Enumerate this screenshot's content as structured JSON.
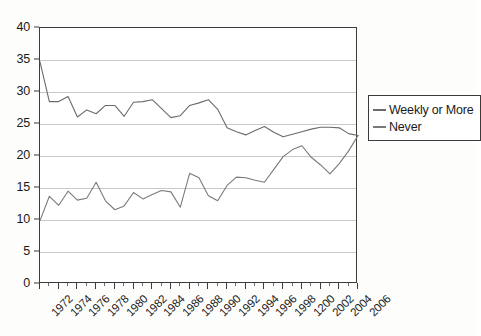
{
  "chart_data": {
    "type": "line",
    "title": "",
    "subtitle": "",
    "xlabel": "",
    "ylabel": "",
    "xlim": [
      1972,
      2006
    ],
    "ylim": [
      0,
      40
    ],
    "grid": true,
    "legend_position": "right",
    "y_ticks": [
      0,
      5,
      10,
      15,
      20,
      25,
      30,
      35,
      40
    ],
    "y_tick_labels": [
      "0",
      "5",
      "10",
      "15",
      "20",
      "25",
      "30",
      "35",
      "40"
    ],
    "x_tick_labels": [
      "1972",
      "1974",
      "1976",
      "1978",
      "1980",
      "1982",
      "1984",
      "1986",
      "1988",
      "1990",
      "1992",
      "1994",
      "1996",
      "1998",
      "1200",
      "2002",
      "2004",
      "2006"
    ],
    "x_tick_values": [
      1972,
      1974,
      1976,
      1978,
      1980,
      1982,
      1984,
      1986,
      1988,
      1990,
      1992,
      1994,
      1996,
      1998,
      2000,
      2002,
      2004,
      2006
    ],
    "x": [
      1972,
      1973,
      1974,
      1975,
      1976,
      1977,
      1978,
      1979,
      1980,
      1981,
      1982,
      1983,
      1984,
      1985,
      1986,
      1987,
      1988,
      1989,
      1990,
      1991,
      1992,
      1993,
      1994,
      1995,
      1996,
      1997,
      1998,
      1999,
      2000,
      2001,
      2002,
      2003,
      2004,
      2005,
      2006
    ],
    "series": [
      {
        "name": "Weekly or More",
        "color": "#6b6b6b",
        "values": [
          34.7,
          28.5,
          28.5,
          29.3,
          26.1,
          27.2,
          26.6,
          27.9,
          27.9,
          26.2,
          28.4,
          28.5,
          28.8,
          27.4,
          26.0,
          26.3,
          27.9,
          28.3,
          28.8,
          27.3,
          24.4,
          23.8,
          23.3,
          24.0,
          24.6,
          23.7,
          23.0,
          23.4,
          23.8,
          24.2,
          24.5,
          24.5,
          24.4,
          23.5,
          23.2
        ]
      },
      {
        "name": "Never",
        "color": "#7a7a7a",
        "values": [
          9.9,
          13.7,
          12.3,
          14.5,
          13.1,
          13.4,
          15.9,
          13.0,
          11.6,
          12.2,
          14.3,
          13.3,
          14.0,
          14.6,
          14.4,
          12.0,
          17.3,
          16.6,
          13.8,
          13.0,
          15.4,
          16.7,
          16.6,
          16.2,
          15.9,
          17.9,
          19.9,
          21.0,
          21.6,
          19.8,
          18.6,
          17.2,
          18.8,
          20.8,
          23.2
        ]
      }
    ]
  },
  "legend": {
    "entries": [
      {
        "label": "Weekly or More"
      },
      {
        "label": "Never"
      }
    ]
  }
}
